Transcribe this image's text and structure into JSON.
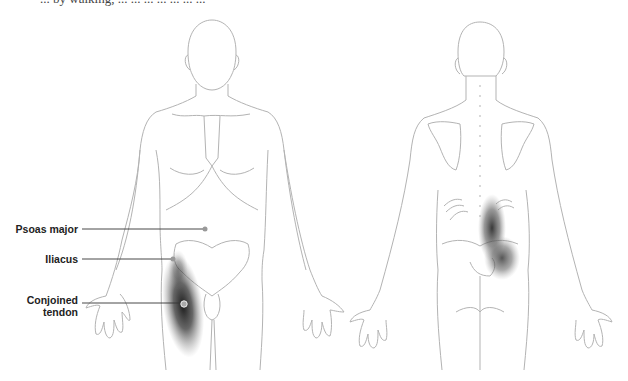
{
  "caption_fragment": "... by walking, ... ... ... ... ... ... ...",
  "figure": {
    "views": [
      "front",
      "back"
    ],
    "labels": [
      {
        "id": "psoas",
        "text": "Psoas major"
      },
      {
        "id": "iliacus",
        "text": "Iliacus"
      },
      {
        "id": "conjoined",
        "text_line1": "Conjoined",
        "text_line2": "tendon"
      }
    ],
    "colors": {
      "outline": "#b0b0b0",
      "leader": "#333333",
      "pain_shade": "#1a1a1a",
      "marker": "#999999"
    }
  }
}
